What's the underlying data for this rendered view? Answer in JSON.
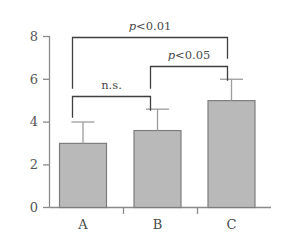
{
  "chart_data": {
    "type": "bar",
    "title": "",
    "xlabel": "",
    "ylabel": "",
    "categories": [
      "A",
      "B",
      "C"
    ],
    "values": [
      3.0,
      3.6,
      5.0
    ],
    "error_upper": [
      1.0,
      1.0,
      1.0
    ],
    "error_bar_tops": [
      4.0,
      4.6,
      6.0
    ],
    "ylim": [
      0,
      8
    ],
    "yticks": [
      0,
      2,
      4,
      6,
      8
    ],
    "ytick_labels": [
      "0",
      "2",
      "4",
      "6",
      "8"
    ],
    "grid": false,
    "legend": false,
    "bar_fill": "#b9b9b9",
    "bar_stroke": "#7d7d7d",
    "axis_color": "#8a8a8a",
    "error_bar_color": "#9a9a9a",
    "bracket_color": "#3f3f3f",
    "annotations": [
      {
        "id": "sig-a-c",
        "label": "p<0.01",
        "italic_prefix": "p",
        "rest": "<0.01",
        "from": "A",
        "to": "C",
        "level": 3
      },
      {
        "id": "sig-b-c",
        "label": "p<0.05",
        "italic_prefix": "p",
        "rest": "<0.05",
        "from": "B",
        "to": "C",
        "level": 2
      },
      {
        "id": "sig-a-b",
        "label": "n.s.",
        "italic_prefix": "",
        "rest": "n.s.",
        "from": "A",
        "to": "B",
        "level": 1
      }
    ]
  },
  "axis": {
    "y_labels": [
      "8",
      "6",
      "4",
      "2",
      "0"
    ],
    "x_labels": [
      "A",
      "B",
      "C"
    ]
  },
  "significance": {
    "top": {
      "p_italic": "p",
      "p_rest": "<0.01"
    },
    "middle": {
      "p_italic": "p",
      "p_rest": "<0.05"
    },
    "bottom": {
      "text": "n.s."
    }
  }
}
